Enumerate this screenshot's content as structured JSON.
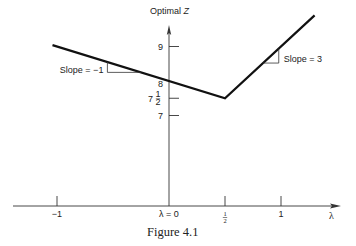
{
  "figure": {
    "caption": "Figure 4.1",
    "y_axis_label_prefix": "Optimal ",
    "y_axis_label_var": "Z",
    "x_axis_label": "λ"
  },
  "chart_data": {
    "type": "line",
    "title": "",
    "xlabel": "λ",
    "ylabel": "Optimal Z",
    "xlim": [
      -1.5,
      1.65
    ],
    "ylim": [
      5.0,
      10.4
    ],
    "x_ticks": [
      {
        "value": -1,
        "label": "−1"
      },
      {
        "value": 0,
        "label": "λ = 0"
      },
      {
        "value": 0.5,
        "label": "½"
      },
      {
        "value": 1,
        "label": "1"
      }
    ],
    "y_ticks": [
      {
        "value": 9,
        "label": "9"
      },
      {
        "value": 8,
        "label": "8"
      },
      {
        "value": 7.5,
        "label": "7 ½"
      },
      {
        "value": 7,
        "label": "7"
      }
    ],
    "series": [
      {
        "name": "Optimal Z",
        "points": [
          {
            "x": -1.04,
            "y": 9.04
          },
          {
            "x": 0.5,
            "y": 7.5
          },
          {
            "x": 1.3,
            "y": 9.9
          }
        ]
      }
    ],
    "annotations": [
      {
        "text": "Slope = −1",
        "segment": "left",
        "slope": -1
      },
      {
        "text": "Slope = 3",
        "segment": "right",
        "slope": 3
      }
    ],
    "grid": false,
    "legend": "none"
  }
}
